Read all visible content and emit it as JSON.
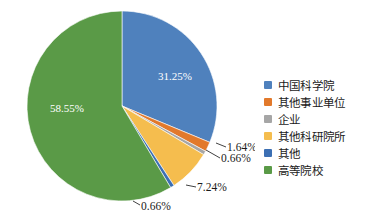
{
  "chart_data": {
    "type": "pie",
    "title": "",
    "subtitle": "",
    "xlabel": "",
    "ylabel": "",
    "grid": false,
    "legend_position": "right",
    "start_angle_deg": 0,
    "direction": "clockwise",
    "categories": [
      "中国科学院",
      "其他事业单位",
      "企业",
      "其他科研院所",
      "其他",
      "高等院校"
    ],
    "values": [
      31.25,
      1.64,
      0.66,
      7.24,
      0.66,
      58.55
    ],
    "value_labels": [
      "31.25%",
      "1.64%",
      "0.66%",
      "7.24%",
      "0.66%",
      "58.55%"
    ],
    "colors": [
      "#4f81bd",
      "#e2792b",
      "#a6a6a6",
      "#f5bd4e",
      "#3c6fb3",
      "#5a9a47"
    ],
    "slices": [
      {
        "name": "中国科学院",
        "value": 31.25,
        "label": "31.25%",
        "color": "#4f81bd",
        "label_placement": "inside"
      },
      {
        "name": "其他事业单位",
        "value": 1.64,
        "label": "1.64%",
        "color": "#e2792b",
        "label_placement": "callout"
      },
      {
        "name": "企业",
        "value": 0.66,
        "label": "0.66%",
        "color": "#a6a6a6",
        "label_placement": "callout"
      },
      {
        "name": "其他科研院所",
        "value": 7.24,
        "label": "7.24%",
        "color": "#f5bd4e",
        "label_placement": "callout"
      },
      {
        "name": "其他",
        "value": 0.66,
        "label": "0.66%",
        "color": "#3c6fb3",
        "label_placement": "callout"
      },
      {
        "name": "高等院校",
        "value": 58.55,
        "label": "58.55%",
        "color": "#5a9a47",
        "label_placement": "inside"
      }
    ]
  },
  "legend": {
    "items": [
      {
        "label": "中国科学院",
        "color": "#4f81bd"
      },
      {
        "label": "其他事业单位",
        "color": "#e2792b"
      },
      {
        "label": "企业",
        "color": "#a6a6a6"
      },
      {
        "label": "其他科研院所",
        "color": "#f5bd4e"
      },
      {
        "label": "其他",
        "color": "#3c6fb3"
      },
      {
        "label": "高等院校",
        "color": "#5a9a47"
      }
    ]
  },
  "labels": {
    "slice_0": "31.25%",
    "slice_1": "1.64%",
    "slice_2": "0.66%",
    "slice_3": "7.24%",
    "slice_4": "0.66%",
    "slice_5": "58.55%"
  }
}
